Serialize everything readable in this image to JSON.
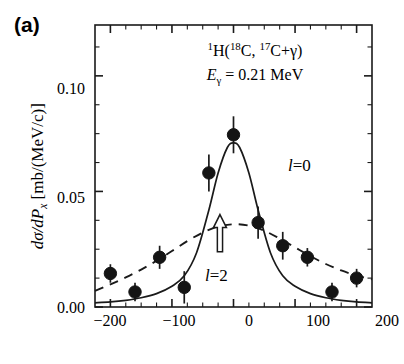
{
  "panel": {
    "label": "(a)"
  },
  "annotations": {
    "reaction_pre": "1",
    "reaction": "H(",
    "projectile_mass": "18",
    "projectile": "C, ",
    "fragment_mass": "17",
    "fragment": "C+",
    "gamma": "γ",
    "reaction_close": ")",
    "egamma_symbol": "E",
    "egamma_sub": "γ",
    "egamma_value": " = 0.21 MeV",
    "l0_label_l": "l",
    "l0_label_eq": "=0",
    "l2_label_l": "l",
    "l2_label_eq": "=2",
    "arrow_marker": "up-arrow-hollow"
  },
  "axes": {
    "ylabel_dsigma": "dσ/d",
    "ylabel_P": "P",
    "ylabel_Psub": "x",
    "ylabel_units": " [mb/(MeV/c)]",
    "y_ticks": [
      "0.00",
      "0.05",
      "0.10"
    ],
    "x_ticks": [
      "−200",
      "−100",
      "0",
      "100",
      "200"
    ]
  },
  "chart_data": {
    "type": "scatter",
    "title": "",
    "xlabel": "",
    "ylabel": "dσ/dP_x [mb/(MeV/c)]",
    "xlim": [
      -225,
      225
    ],
    "ylim": [
      0.0,
      0.122
    ],
    "x_ticks": [
      -200,
      -100,
      0,
      100,
      200
    ],
    "y_ticks": [
      0.0,
      0.05,
      0.1
    ],
    "x_minor_step": 25,
    "y_minor_step": 0.0125,
    "grid": false,
    "legend": "inline-annotations",
    "points": {
      "name": "measured cross section",
      "marker": "filled-circle",
      "x": [
        -200,
        -160,
        -120,
        -80,
        -40,
        0,
        40,
        80,
        120,
        160,
        200
      ],
      "y": [
        0.0145,
        0.0065,
        0.0215,
        0.0085,
        0.058,
        0.0745,
        0.0365,
        0.0265,
        0.0215,
        0.0065,
        0.0125
      ],
      "yerr": [
        0.004,
        0.004,
        0.005,
        0.007,
        0.008,
        0.008,
        0.007,
        0.006,
        0.004,
        0.004,
        0.004
      ]
    },
    "series": [
      {
        "name": "l=0",
        "style": "solid",
        "x": [
          -225,
          -200,
          -175,
          -150,
          -125,
          -100,
          -80,
          -60,
          -40,
          -25,
          -10,
          0,
          10,
          25,
          40,
          60,
          80,
          100,
          125,
          150,
          175,
          200,
          225
        ],
        "y": [
          0.0018,
          0.0022,
          0.0029,
          0.004,
          0.0058,
          0.009,
          0.0135,
          0.0235,
          0.042,
          0.058,
          0.069,
          0.071,
          0.069,
          0.058,
          0.042,
          0.0235,
          0.0135,
          0.009,
          0.0058,
          0.004,
          0.0029,
          0.0022,
          0.0018
        ]
      },
      {
        "name": "l=2",
        "style": "dashed",
        "x": [
          -225,
          -200,
          -175,
          -150,
          -125,
          -100,
          -75,
          -50,
          -25,
          0,
          25,
          50,
          75,
          100,
          125,
          150,
          175,
          200,
          225
        ],
        "y": [
          0.007,
          0.0098,
          0.0128,
          0.0162,
          0.02,
          0.0242,
          0.0285,
          0.0322,
          0.0348,
          0.0358,
          0.0352,
          0.033,
          0.0296,
          0.0258,
          0.022,
          0.0186,
          0.0158,
          0.0136,
          0.012
        ]
      }
    ],
    "arrow_annotation": {
      "x": -22,
      "y_base": 0.03,
      "y_tip": 0.04,
      "direction": "up"
    }
  }
}
